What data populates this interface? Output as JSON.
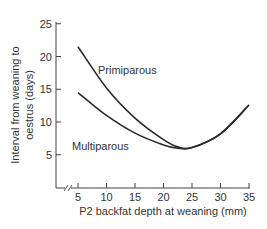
{
  "chart_data": {
    "type": "line",
    "title": "",
    "xlabel": "P2 backfat depth at weaning (mm)",
    "ylabel_line1": "Interval from weaning to",
    "ylabel_line2": "oestrus (days)",
    "ylabel": "Interval from weaning to oestrus (days)",
    "xlim": [
      5,
      35
    ],
    "ylim": [
      0,
      25
    ],
    "x_ticks": [
      5,
      10,
      15,
      20,
      25,
      30,
      35
    ],
    "y_ticks": [
      5,
      10,
      15,
      20,
      25
    ],
    "x_axis_break": true,
    "grid": false,
    "legend": "inline labels",
    "x": [
      5,
      10,
      15,
      20,
      22.5,
      25,
      30,
      35
    ],
    "series": [
      {
        "name": "Primiparous",
        "values": [
          21.5,
          15.2,
          10.6,
          7.3,
          6.2,
          6.1,
          8.2,
          12.6
        ]
      },
      {
        "name": "Multiparous",
        "values": [
          14.5,
          11.0,
          8.3,
          6.5,
          6.0,
          6.1,
          8.2,
          12.6
        ]
      }
    ],
    "annotations": [
      {
        "text": "Primiparous",
        "x": 13,
        "y": 20.5
      },
      {
        "text": "Multiparous",
        "x": 11,
        "y": 7.5
      }
    ]
  },
  "colors": {
    "line": "#2a2a2a",
    "axis": "#444444",
    "text": "#333333"
  }
}
